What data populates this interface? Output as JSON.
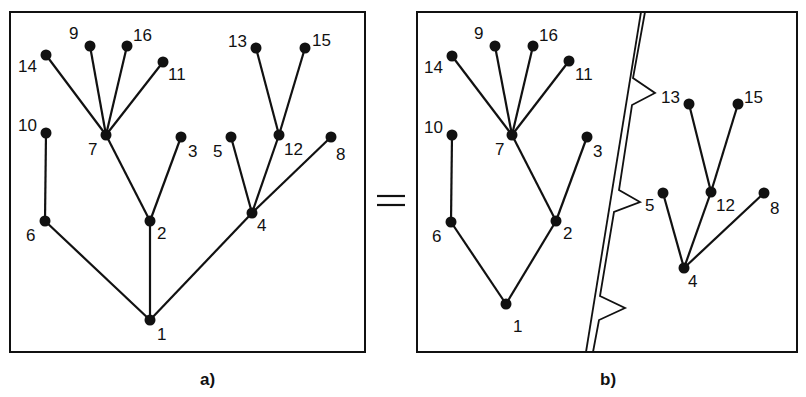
{
  "equals_sign": "=",
  "panels": [
    {
      "id": "a",
      "caption": "a)",
      "box": [
        10,
        12,
        365,
        352
      ],
      "nodes": [
        {
          "id": "1",
          "x": 150,
          "y": 320,
          "lx": 157,
          "ly": 340
        },
        {
          "id": "2",
          "x": 150,
          "y": 221,
          "lx": 157,
          "ly": 239
        },
        {
          "id": "3",
          "x": 181,
          "y": 137,
          "lx": 188,
          "ly": 157
        },
        {
          "id": "4",
          "x": 252,
          "y": 213,
          "lx": 257,
          "ly": 231
        },
        {
          "id": "5",
          "x": 231,
          "y": 137,
          "lx": 213,
          "ly": 157
        },
        {
          "id": "6",
          "x": 45,
          "y": 221,
          "lx": 26,
          "ly": 241
        },
        {
          "id": "7",
          "x": 106,
          "y": 135,
          "lx": 88,
          "ly": 155
        },
        {
          "id": "8",
          "x": 331,
          "y": 137,
          "lx": 336,
          "ly": 160
        },
        {
          "id": "9",
          "x": 90,
          "y": 46,
          "lx": 69,
          "ly": 39
        },
        {
          "id": "10",
          "x": 46,
          "y": 133,
          "lx": 18,
          "ly": 131
        },
        {
          "id": "11",
          "x": 163,
          "y": 62,
          "lx": 168,
          "ly": 80
        },
        {
          "id": "12",
          "x": 279,
          "y": 135,
          "lx": 284,
          "ly": 155
        },
        {
          "id": "13",
          "x": 256,
          "y": 48,
          "lx": 228,
          "ly": 47
        },
        {
          "id": "14",
          "x": 46,
          "y": 55,
          "lx": 18,
          "ly": 72
        },
        {
          "id": "15",
          "x": 305,
          "y": 48,
          "lx": 312,
          "ly": 46
        },
        {
          "id": "16",
          "x": 127,
          "y": 46,
          "lx": 133,
          "ly": 41
        }
      ],
      "edges": [
        [
          "1",
          "6"
        ],
        [
          "1",
          "2"
        ],
        [
          "1",
          "4"
        ],
        [
          "6",
          "10"
        ],
        [
          "2",
          "7"
        ],
        [
          "2",
          "3"
        ],
        [
          "7",
          "14"
        ],
        [
          "7",
          "9"
        ],
        [
          "7",
          "16"
        ],
        [
          "7",
          "11"
        ],
        [
          "4",
          "5"
        ],
        [
          "4",
          "12"
        ],
        [
          "4",
          "8"
        ],
        [
          "12",
          "13"
        ],
        [
          "12",
          "15"
        ]
      ]
    },
    {
      "id": "b",
      "caption": "b)",
      "box": [
        417,
        12,
        797,
        352
      ],
      "nodes": [
        {
          "id": "1",
          "x": 506,
          "y": 304,
          "lx": 513,
          "ly": 332
        },
        {
          "id": "2",
          "x": 556,
          "y": 221,
          "lx": 563,
          "ly": 239
        },
        {
          "id": "3",
          "x": 587,
          "y": 137,
          "lx": 593,
          "ly": 157
        },
        {
          "id": "4",
          "x": 684,
          "y": 268,
          "lx": 688,
          "ly": 287
        },
        {
          "id": "5",
          "x": 663,
          "y": 193,
          "lx": 645,
          "ly": 211
        },
        {
          "id": "6",
          "x": 451,
          "y": 222,
          "lx": 432,
          "ly": 242
        },
        {
          "id": "7",
          "x": 512,
          "y": 135,
          "lx": 495,
          "ly": 155
        },
        {
          "id": "8",
          "x": 764,
          "y": 193,
          "lx": 770,
          "ly": 214
        },
        {
          "id": "9",
          "x": 495,
          "y": 46,
          "lx": 474,
          "ly": 39
        },
        {
          "id": "10",
          "x": 452,
          "y": 135,
          "lx": 424,
          "ly": 133
        },
        {
          "id": "11",
          "x": 569,
          "y": 61,
          "lx": 575,
          "ly": 80
        },
        {
          "id": "12",
          "x": 711,
          "y": 192,
          "lx": 716,
          "ly": 211
        },
        {
          "id": "13",
          "x": 689,
          "y": 104,
          "lx": 661,
          "ly": 103
        },
        {
          "id": "14",
          "x": 452,
          "y": 56,
          "lx": 424,
          "ly": 73
        },
        {
          "id": "15",
          "x": 738,
          "y": 104,
          "lx": 744,
          "ly": 103
        },
        {
          "id": "16",
          "x": 533,
          "y": 46,
          "lx": 539,
          "ly": 41
        }
      ],
      "edges": [
        [
          "1",
          "6"
        ],
        [
          "1",
          "2"
        ],
        [
          "6",
          "10"
        ],
        [
          "2",
          "7"
        ],
        [
          "2",
          "3"
        ],
        [
          "7",
          "14"
        ],
        [
          "7",
          "9"
        ],
        [
          "7",
          "16"
        ],
        [
          "7",
          "11"
        ],
        [
          "4",
          "5"
        ],
        [
          "4",
          "12"
        ],
        [
          "4",
          "8"
        ],
        [
          "12",
          "13"
        ],
        [
          "12",
          "15"
        ]
      ]
    }
  ],
  "cut_line": {
    "outer": [
      [
        641,
        12
      ],
      [
        586,
        352
      ]
    ],
    "inner": "645,12 633,78 655,93 632,105 619,190 640,202 614,212 600,296 625,308 599,320 593,352",
    "tips_to": [
      "13",
      "5",
      ""
    ]
  },
  "colors": {
    "ink": "#111111",
    "paper": "#ffffff"
  }
}
